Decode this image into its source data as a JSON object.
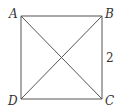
{
  "diagram": {
    "type": "geometry",
    "shape": "square",
    "vertices": {
      "A": {
        "label": "A",
        "x": 21,
        "y": 16
      },
      "B": {
        "label": "B",
        "x": 102,
        "y": 16
      },
      "C": {
        "label": "C",
        "x": 102,
        "y": 99
      },
      "D": {
        "label": "D",
        "x": 21,
        "y": 99
      }
    },
    "edges": [
      [
        "A",
        "B"
      ],
      [
        "B",
        "C"
      ],
      [
        "C",
        "D"
      ],
      [
        "D",
        "A"
      ]
    ],
    "diagonals": [
      [
        "A",
        "C"
      ],
      [
        "B",
        "D"
      ]
    ],
    "side_label": {
      "edge": "BC",
      "text": "2"
    }
  }
}
